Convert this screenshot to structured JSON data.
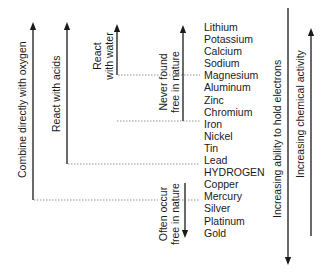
{
  "elements": [
    "Lithium",
    "Potassium",
    "Calcium",
    "Sodium",
    "Magnesium",
    "Aluminum",
    "Zinc",
    "Chromium",
    "Iron",
    "Nickel",
    "Tin",
    "Lead",
    "HYDROGEN",
    "Copper",
    "Mercury",
    "Silver",
    "Platinum",
    "Gold"
  ],
  "labels": {
    "combine_oxygen": "Combine directly with oxygen",
    "react_acids": "React with acids",
    "react_water_line1": "React",
    "react_water_line2": "with water",
    "never_free_line1": "Never found",
    "never_free_line2": "free in nature",
    "often_free_line1": "Often occur",
    "often_free_line2": "free in nature",
    "hold_electrons": "Increasing ability to hold electrons",
    "chemical_activity": "Increasing chemical activity"
  },
  "colors": {
    "line": "#1a1a1a",
    "dotted": "#777777"
  }
}
